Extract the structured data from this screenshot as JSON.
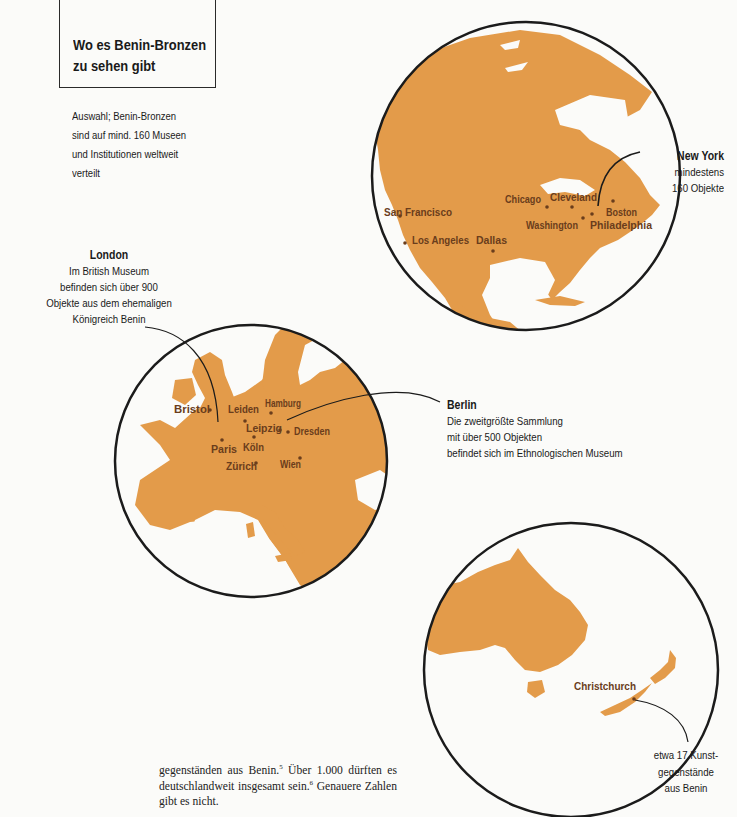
{
  "title": {
    "line1": "Wo es Benin-Bronzen",
    "line2": "zu sehen gibt"
  },
  "subtitle": {
    "lines": [
      "Auswahl; Benin-Bronzen",
      "sind auf mind. 160 Museen",
      "und Institutionen weltweit",
      "verteilt"
    ]
  },
  "colors": {
    "land": "#e39b4a",
    "circle_outline": "#1b1b1b",
    "city_dot": "#6a3d1c",
    "background": "#fbfbf9"
  },
  "maps": {
    "north_america": {
      "region": "Nordamerika",
      "cities": [
        "San Francisco",
        "Los Angeles",
        "Dallas",
        "Chicago",
        "Cleveland",
        "Washington",
        "Philadelphia",
        "Boston"
      ],
      "highlight_city": "New York"
    },
    "europe": {
      "region": "Europa",
      "cities": [
        "Bristol",
        "Leiden",
        "Hamburg",
        "Leipzig",
        "Dresden",
        "Paris",
        "Köln",
        "Zürich",
        "Wien"
      ],
      "highlight_cities": [
        "London",
        "Berlin"
      ]
    },
    "oceania": {
      "region": "Australien / Neuseeland",
      "cities": [
        "Christchurch"
      ],
      "highlight_city": "Christchurch"
    }
  },
  "callouts": {
    "new_york": {
      "heading": "New York",
      "lines": [
        "mindestens",
        "160 Objekte"
      ]
    },
    "london": {
      "heading": "London",
      "lines": [
        "Im British Museum",
        "befinden sich über 900",
        "Objekte aus dem ehemaligen",
        "Königreich Benin"
      ]
    },
    "berlin": {
      "heading": "Berlin",
      "lines": [
        "Die zweitgrößte Sammlung",
        "mit über 500 Objekten",
        "befindet sich im Ethnologischen Museum"
      ]
    },
    "christchurch": {
      "lines": [
        "etwa 17 Kunst-",
        "gegenstände",
        "aus Benin"
      ]
    }
  },
  "body_text": {
    "part1": "gegenständen aus Benin.",
    "fn1": "5",
    "part2": " Über 1.000 dürften es deutschlandweit insgesamt sein.",
    "fn2": "6",
    "part3": " Genauere Zahlen gibt es nicht."
  }
}
